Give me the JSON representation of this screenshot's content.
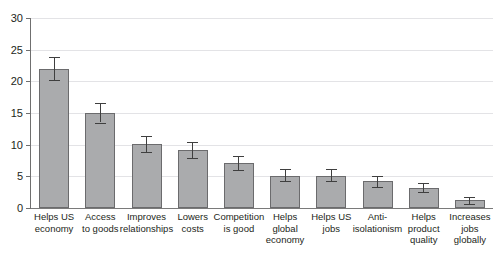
{
  "chart_data": {
    "type": "bar",
    "title": "",
    "subtitle": "",
    "xlabel": "",
    "ylabel": "",
    "ylim": [
      0,
      30
    ],
    "yticks": [
      0,
      5,
      10,
      15,
      20,
      25,
      30
    ],
    "ytick_labels": [
      "0",
      "5",
      "10",
      "15",
      "20",
      "25",
      "30"
    ],
    "grid": true,
    "legend": false,
    "legend_position": "none",
    "error_bars": true,
    "categories": [
      "Helps US economy",
      "Access to goods",
      "Improves relationships",
      "Lowers costs",
      "Competition is good",
      "Helps global economy",
      "Helps US jobs",
      "Anti-isolationism",
      "Helps product quality",
      "Increases jobs globally"
    ],
    "category_lines": [
      [
        "Helps US",
        "economy"
      ],
      [
        "Access",
        "to goods"
      ],
      [
        "Improves",
        "relationships"
      ],
      [
        "Lowers",
        "costs"
      ],
      [
        "Competition",
        "is good"
      ],
      [
        "Helps",
        "global",
        "economy"
      ],
      [
        "Helps US",
        "jobs"
      ],
      [
        "Anti-",
        "isolationism"
      ],
      [
        "Helps",
        "product",
        "quality"
      ],
      [
        "Increases jobs",
        "globally"
      ]
    ],
    "values": [
      22.0,
      15.0,
      10.1,
      9.2,
      7.1,
      5.1,
      5.1,
      4.2,
      3.2,
      1.2
    ],
    "errors_low": [
      20.2,
      13.5,
      8.8,
      7.9,
      6.0,
      4.2,
      4.2,
      3.3,
      2.5,
      0.7
    ],
    "errors_high": [
      23.8,
      16.6,
      11.4,
      10.4,
      8.2,
      6.1,
      6.1,
      5.1,
      4.0,
      1.8
    ]
  },
  "style": {
    "bar_fill": "#aaabad",
    "bar_stroke": "#6b6b6d",
    "grid_color": "#e3e3e6",
    "axis_color": "#6f6f6f",
    "error_color": "#3f3f3f",
    "text_color": "#231f20",
    "background": "#ffffff"
  }
}
